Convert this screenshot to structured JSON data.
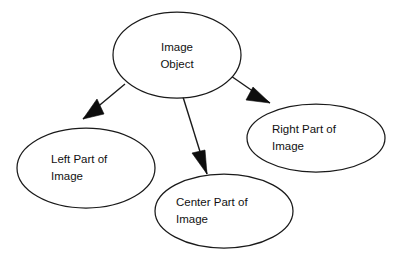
{
  "diagram": {
    "background_color": "#ffffff",
    "stroke_color": "#1a1a1a",
    "arrow_fill_color": "#0d0d0d",
    "text_color": "#111111",
    "nodes": [
      {
        "id": "image-object",
        "label_line1": "Image",
        "label_line2": "Object",
        "text_align": "center",
        "cx": 177,
        "cy": 55,
        "rx": 64,
        "ry": 43
      },
      {
        "id": "left-part",
        "label_line1": "Left Part of",
        "label_line2": "Image",
        "text_align": "left",
        "cx": 86,
        "cy": 168,
        "rx": 69,
        "ry": 40
      },
      {
        "id": "center-part",
        "label_line1": "Center Part of",
        "label_line2": "Image",
        "text_align": "left",
        "cx": 224,
        "cy": 211,
        "rx": 69,
        "ry": 37
      },
      {
        "id": "right-part",
        "label_line1": "Right Part of",
        "label_line2": "Image",
        "text_align": "left",
        "cx": 316,
        "cy": 138,
        "rx": 69,
        "ry": 34
      }
    ],
    "edges": [
      {
        "id": "edge-to-left",
        "from": "image-object",
        "to": "left-part",
        "line": {
          "x1": 125,
          "y1": 84,
          "x2": 83,
          "y2": 119
        },
        "arrow_points": "83,119 97,99 104,114"
      },
      {
        "id": "edge-to-center",
        "from": "image-object",
        "to": "center-part",
        "line": {
          "x1": 183,
          "y1": 97,
          "x2": 207,
          "y2": 174
        },
        "arrow_points": "207,174 192,153 205,150"
      },
      {
        "id": "edge-to-right",
        "from": "image-object",
        "to": "right-part",
        "line": {
          "x1": 231,
          "y1": 76,
          "x2": 270,
          "y2": 103
        },
        "arrow_points": "270,103 246,100 253,87"
      }
    ]
  }
}
